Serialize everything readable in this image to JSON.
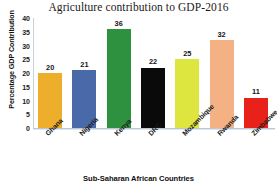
{
  "chart_data": {
    "type": "bar",
    "title": "Agriculture contribution to GDP-2016",
    "xlabel": "Sub-Saharan African Countries",
    "ylabel": "Percentage GDP Contribution",
    "categories": [
      "Ghana",
      "Nigeria",
      "Kenya",
      "DRC",
      "Mozambique",
      "Rwanda",
      "Zimbabwe"
    ],
    "values": [
      20,
      21,
      36,
      22,
      25,
      32,
      11
    ],
    "bar_colors": [
      "#EDAE2B",
      "#4A69A8",
      "#2E9140",
      "#0A0A0A",
      "#DDE63F",
      "#F4B183",
      "#E8221A"
    ],
    "ylim": [
      0,
      40
    ],
    "yticks": [
      0,
      5,
      10,
      15,
      20,
      25,
      30,
      35,
      40
    ],
    "ytick_labels": [
      "0",
      "5",
      "10",
      "15",
      "20",
      "25",
      "30",
      "35",
      "40"
    ],
    "grid": false,
    "legend": "none",
    "data_labels": [
      "20",
      "21",
      "36",
      "22",
      "25",
      "32",
      "11"
    ]
  }
}
